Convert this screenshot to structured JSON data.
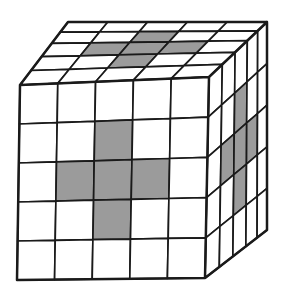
{
  "figure": {
    "kind": "cube-grid-figure",
    "grid_size": 5,
    "colors": {
      "background": "#ffffff",
      "line": "#1a1a1a",
      "cell": "#ffffff",
      "shaded": "#9b9b9b"
    },
    "faces": [
      {
        "name": "top",
        "rows": 5,
        "cols": 5,
        "shaded_cells": [
          [
            1,
            2
          ],
          [
            2,
            1
          ],
          [
            2,
            2
          ],
          [
            2,
            3
          ],
          [
            3,
            2
          ]
        ]
      },
      {
        "name": "right",
        "rows": 5,
        "cols": 5,
        "shaded_cells": [
          [
            1,
            2
          ],
          [
            2,
            1
          ],
          [
            2,
            2
          ],
          [
            2,
            3
          ],
          [
            3,
            2
          ]
        ]
      },
      {
        "name": "front",
        "rows": 5,
        "cols": 5,
        "shaded_cells": [
          [
            1,
            2
          ],
          [
            2,
            1
          ],
          [
            2,
            2
          ],
          [
            2,
            3
          ],
          [
            3,
            2
          ]
        ]
      }
    ]
  }
}
